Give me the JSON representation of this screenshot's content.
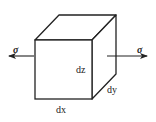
{
  "diagram": {
    "stroke_color": "#222222",
    "labels": {
      "dz": "dz",
      "dy": "dy",
      "dx": "dx",
      "sigma_left": "σ",
      "sigma_right": "σ"
    }
  }
}
